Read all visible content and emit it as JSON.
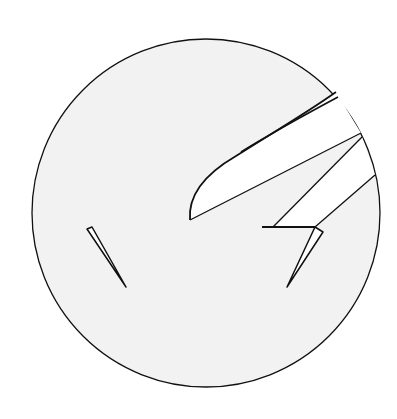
{
  "figure": {
    "colors": {
      "background": "#ffffff",
      "field": "#f2f2f2",
      "shape_fill": "#ffffff",
      "stroke": "#111111"
    }
  }
}
